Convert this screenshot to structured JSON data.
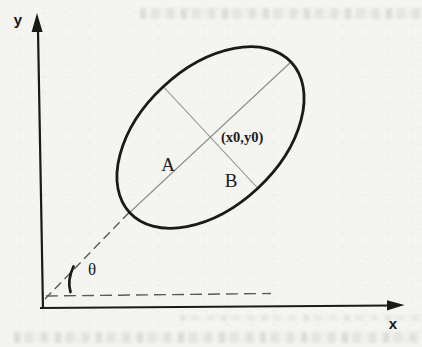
{
  "labels": {
    "y_axis": "y",
    "x_axis": "x",
    "semi_major": "A",
    "semi_minor": "B",
    "center_point": "(x0,y0)",
    "rotation_angle": "θ"
  },
  "colors": {
    "background": "#f4f4f1",
    "ink": "#1a1a1a",
    "thin_axis_gray": "#8d8d8d",
    "dash_gray": "#5a5a5a"
  }
}
